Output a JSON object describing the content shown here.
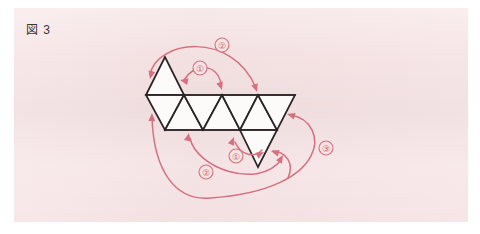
{
  "figure": {
    "label": "図 3",
    "caption_prefix": "図",
    "caption_number": "3",
    "panel_background": "#f6e3e4",
    "page_background": "#ffffff",
    "line_color": "#2b2426",
    "face_color": "#fdfbfa",
    "annotation_color": "#d4707f"
  },
  "net": {
    "name": "triangle-strip-net",
    "description": "triangular net strip",
    "top_edge_y": 95,
    "bottom_edge_y": 130,
    "faces": [
      {
        "id": "face-top-apex",
        "points": "165,57 146,95 184,95"
      },
      {
        "id": "face-1-down",
        "points": "146,95 184,95 165,130"
      },
      {
        "id": "face-2-up",
        "points": "184,95 165,130 203,130"
      },
      {
        "id": "face-3-down",
        "points": "184,95 222,95 203,130"
      },
      {
        "id": "face-4-up",
        "points": "222,95 203,130 240,130"
      },
      {
        "id": "face-5-down",
        "points": "222,95 258,95 240,130"
      },
      {
        "id": "face-6-up",
        "points": "258,95 240,130 277,130"
      },
      {
        "id": "face-7-down",
        "points": "258,95 295,95 277,130"
      },
      {
        "id": "face-bottom-apex",
        "points": "240,130 277,130 258,167"
      }
    ],
    "edges": [
      {
        "id": "edge-top-rail",
        "d": "M146,95 L295,95"
      },
      {
        "id": "edge-bottom-rail",
        "d": "M165,130 L277,130"
      }
    ]
  },
  "annotations": [
    {
      "id": "fold-1-top",
      "label": "①",
      "number": 1,
      "badge": {
        "cx": 200,
        "cy": 68,
        "r": 7
      },
      "position": "top-inner",
      "path": "M184,80 C196,62 216,64 221,83",
      "heads": [
        {
          "id": "head-1-top-left",
          "tip": "180,80",
          "angle": 192
        },
        {
          "id": "head-1-top-right",
          "tip": "222,90",
          "angle": 72
        }
      ]
    },
    {
      "id": "fold-2-top",
      "label": "②",
      "number": 2,
      "badge": {
        "cx": 222,
        "cy": 45,
        "r": 7
      },
      "position": "top-outer",
      "path": "M150,75 C156,40 232,30 256,88",
      "heads": [
        {
          "id": "head-2-top-left",
          "tip": "150,79",
          "angle": 104
        },
        {
          "id": "head-2-top-right",
          "tip": "257,92",
          "angle": 72
        }
      ]
    },
    {
      "id": "fold-1-bottom",
      "label": "①",
      "number": 1,
      "badge": {
        "cx": 236,
        "cy": 156,
        "r": 7
      },
      "position": "bottom-inner",
      "path": "M235,142 C241,156 255,158 262,150",
      "heads": [
        {
          "id": "head-1-bottom-left",
          "tip": "234,137",
          "angle": 292
        },
        {
          "id": "head-1-bottom-right",
          "tip": "264,152",
          "angle": 332
        }
      ]
    },
    {
      "id": "fold-2-bottom",
      "label": "②",
      "number": 2,
      "badge": {
        "cx": 206,
        "cy": 172,
        "r": 7
      },
      "position": "bottom-outer",
      "path": "M190,138 C196,168 258,190 281,160",
      "heads": [
        {
          "id": "head-2-bottom-left",
          "tip": "189,133",
          "angle": 282
        },
        {
          "id": "head-2-bottom-right",
          "tip": "283,155",
          "angle": 300
        }
      ]
    },
    {
      "id": "fold-3-right",
      "label": "③",
      "number": 3,
      "badge": {
        "cx": 326,
        "cy": 148,
        "r": 7
      },
      "position": "right-outer",
      "path": "M291,115 C330,122 332,190 210,198 C176,201 154,172 152,118",
      "heads": [
        {
          "id": "head-3-top",
          "tip": "287,114",
          "angle": 196
        },
        {
          "id": "head-3-bottom",
          "tip": "152,113",
          "angle": 272
        }
      ]
    },
    {
      "id": "fold-2-bottom-tail-arrow",
      "label": "",
      "number": 0,
      "badge": null,
      "position": "bottom-apex-right",
      "path": "M288,178 C295,162 285,152 273,151",
      "heads": [
        {
          "id": "head-apex-right",
          "tip": "271,151",
          "angle": 196
        }
      ]
    }
  ]
}
